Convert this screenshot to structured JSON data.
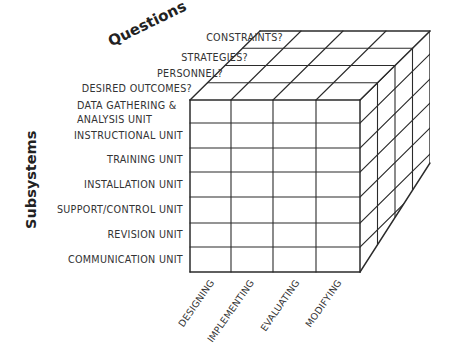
{
  "diagram": {
    "type": "3d-cube-matrix",
    "axis_titles": {
      "questions": "Questions",
      "subsystems": "Subsystems"
    },
    "questions": [
      "DESIRED OUTCOMES?",
      "PERSONNEL?",
      "STRATEGIES?",
      "CONSTRAINTS?"
    ],
    "subsystems": {
      "data_gathering_line1": "DATA GATHERING &",
      "data_gathering_line2": "ANALYSIS UNIT",
      "rows": [
        "INSTRUCTIONAL UNIT",
        "TRAINING UNIT",
        "INSTALLATION UNIT",
        "SUPPORT/CONTROL UNIT",
        "REVISION UNIT",
        "COMMUNICATION UNIT"
      ]
    },
    "phases": [
      "DESIGNING",
      "IMPLEMENTING",
      "EVALUATING",
      "MODIFYING"
    ],
    "geometry": {
      "front_cols_x": [
        190,
        231,
        273,
        316,
        360
      ],
      "front_rows_y": [
        100,
        123,
        148,
        172,
        197,
        223,
        247,
        272
      ],
      "depth_step": [
        17.5,
        -17.25
      ],
      "depth_layers": 4,
      "right_bottom_back": [
        430,
        163
      ],
      "stroke": "#2b2b2b"
    }
  }
}
